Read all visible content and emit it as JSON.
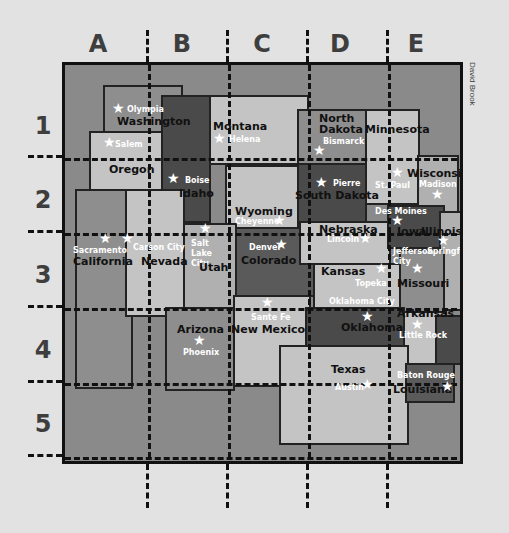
{
  "grid": {
    "columns": [
      "A",
      "B",
      "C",
      "D",
      "E"
    ],
    "rows": [
      "1",
      "2",
      "3",
      "4",
      "5"
    ]
  },
  "credit": "David Brook",
  "colors": {
    "background": "#e2e2e2",
    "ocean": "#8a8a8a",
    "dark_state": "#4a4a4a",
    "mid_state": "#9a9a9a",
    "light_state": "#c4c4c4",
    "frame": "#111111"
  },
  "states": [
    {
      "name": "Washington",
      "capital": "Olympia"
    },
    {
      "name": "Oregon",
      "capital": "Salem"
    },
    {
      "name": "Idaho",
      "capital": "Boise"
    },
    {
      "name": "Montana",
      "capital": "Helena"
    },
    {
      "name": "North Dakota",
      "capital": "Bismarck"
    },
    {
      "name": "Minnesota",
      "capital": "St. Paul"
    },
    {
      "name": "Wisconsin",
      "capital": "Madison"
    },
    {
      "name": "South Dakota",
      "capital": "Pierre"
    },
    {
      "name": "Wyoming",
      "capital": "Cheyenne"
    },
    {
      "name": "California",
      "capital": "Sacramento"
    },
    {
      "name": "Nevada",
      "capital": "Carson City"
    },
    {
      "name": "Utah",
      "capital": "Salt Lake City"
    },
    {
      "name": "Colorado",
      "capital": "Denver"
    },
    {
      "name": "Nebraska",
      "capital": "Lincoln"
    },
    {
      "name": "Iowa",
      "capital": "Des Moines"
    },
    {
      "name": "Illinois",
      "capital": "Springfield"
    },
    {
      "name": "Kansas",
      "capital": "Topeka"
    },
    {
      "name": "Missouri",
      "capital": "Jefferson City"
    },
    {
      "name": "Arizona",
      "capital": "Phoenix"
    },
    {
      "name": "New Mexico",
      "capital": "Sante Fe"
    },
    {
      "name": "Oklahoma",
      "capital": "Oklahoma City"
    },
    {
      "name": "Arkansas",
      "capital": "Little Rock"
    },
    {
      "name": "Texas",
      "capital": "Austin"
    },
    {
      "name": "Louisiana",
      "capital": "Baton Rouge"
    }
  ]
}
